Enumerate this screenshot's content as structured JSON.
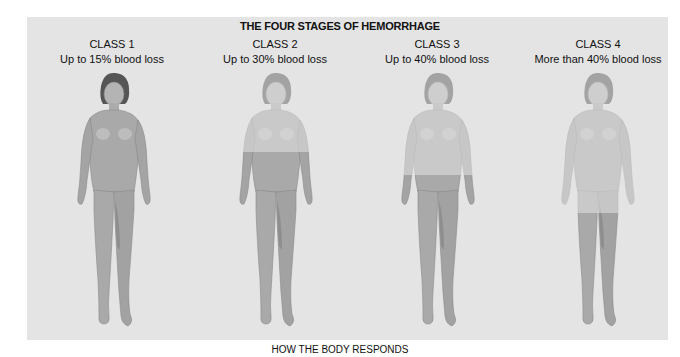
{
  "figure": {
    "title": "THE FOUR STAGES OF HEMORRHAGE",
    "caption": "HOW THE BODY RESPONDS",
    "colors": {
      "panel": "#e4e4e4",
      "body_full": "#a9a9a9",
      "body_faded": "#d2d2d2",
      "hair": "#555555",
      "outline": "#8a8a8a"
    },
    "stages": [
      {
        "class_label": "CLASS 1",
        "loss_label": "Up to 15% blood loss",
        "faded_to_y": 0
      },
      {
        "class_label": "CLASS 2",
        "loss_label": "Up to 30% blood loss",
        "faded_to_y": 82
      },
      {
        "class_label": "CLASS 3",
        "loss_label": "Up to 40% blood loss",
        "faded_to_y": 105
      },
      {
        "class_label": "CLASS 4",
        "loss_label": "More than 40% blood loss",
        "faded_to_y": 143
      }
    ]
  }
}
